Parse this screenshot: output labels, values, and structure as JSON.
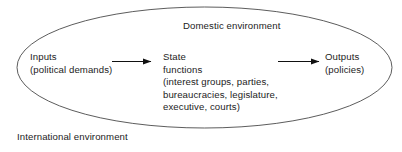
{
  "diagram": {
    "title": "Domestic environment",
    "outer_label": "International environment",
    "boundary_shape": "ellipse",
    "colors": {
      "background": "#ffffff",
      "stroke": "#4a4a4a",
      "text": "#1c1c1c",
      "arrow": "#111111"
    },
    "nodes": [
      {
        "id": "inputs",
        "lines": [
          "Inputs",
          "(political demands)"
        ],
        "line1": "Inputs",
        "line2": "(political demands)"
      },
      {
        "id": "state",
        "lines": [
          "State",
          "functions",
          "(interest groups, parties,",
          "bureaucracies, legislature,",
          "executive, courts)"
        ],
        "line1": "State",
        "line2": "functions",
        "line3": "(interest groups, parties,",
        "line4": "bureaucracies, legislature,",
        "line5": "executive, courts)"
      },
      {
        "id": "outputs",
        "lines": [
          "Outputs",
          "(policies)"
        ],
        "line1": "Outputs",
        "line2": "(policies)"
      }
    ],
    "arrows": [
      {
        "id": "inputs-to-state",
        "from": "inputs",
        "to": "state",
        "direction": "right"
      },
      {
        "id": "state-to-outputs",
        "from": "state",
        "to": "outputs",
        "direction": "right"
      }
    ]
  }
}
